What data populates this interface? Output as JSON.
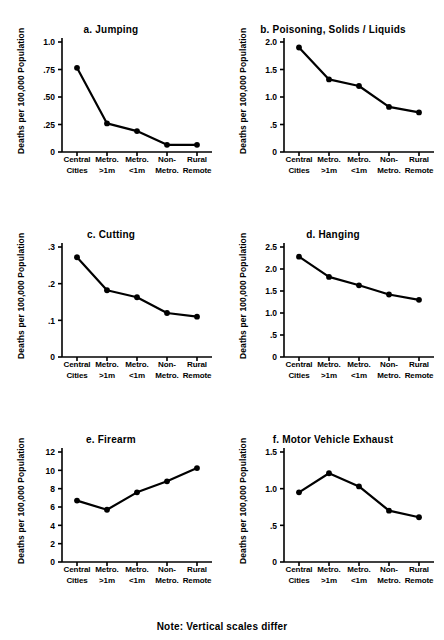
{
  "figure": {
    "footnote": "Note: Vertical scales differ",
    "y_axis_label": "Deaths per 100,000 Population",
    "categories": [
      "Central\nCities",
      "Metro.\n>1m",
      "Metro.\n<1m",
      "Non-\nMetro.",
      "Rural\nRemote"
    ],
    "category_lines": [
      [
        "Central",
        "Cities"
      ],
      [
        "Metro.",
        ">1m"
      ],
      [
        "Metro.",
        "<1m"
      ],
      [
        "Non-",
        "Metro."
      ],
      [
        "Rural",
        "Remote"
      ]
    ],
    "line_color": "#000000",
    "marker_color": "#000000",
    "background": "#ffffff"
  },
  "chart_data": [
    {
      "type": "line",
      "panel": "a",
      "title": "a. Jumping",
      "xlabel": "",
      "ylabel": "Deaths per 100,000 Population",
      "categories": [
        "Central Cities",
        "Metro. >1m",
        "Metro. <1m",
        "Non-Metro.",
        "Rural Remote"
      ],
      "values": [
        0.765,
        0.26,
        0.19,
        0.065,
        0.065
      ],
      "ylim": [
        0,
        1.0
      ],
      "yticks": [
        0,
        0.25,
        0.5,
        0.75,
        1.0
      ],
      "ytick_labels": [
        "0",
        ".25",
        ".50",
        ".75",
        "1.0"
      ],
      "grid": false,
      "legend": "none"
    },
    {
      "type": "line",
      "panel": "b",
      "title": "b. Poisoning, Solids / Liquids",
      "xlabel": "",
      "ylabel": "Deaths per 100,000 Population",
      "categories": [
        "Central Cities",
        "Metro. >1m",
        "Metro. <1m",
        "Non-Metro.",
        "Rural Remote"
      ],
      "values": [
        1.9,
        1.32,
        1.2,
        0.82,
        0.72
      ],
      "ylim": [
        0,
        2.0
      ],
      "yticks": [
        0,
        0.5,
        1.0,
        1.5,
        2.0
      ],
      "ytick_labels": [
        "0",
        ".5",
        "1.0",
        "1.5",
        "2.0"
      ],
      "grid": false,
      "legend": "none"
    },
    {
      "type": "line",
      "panel": "c",
      "title": "c. Cutting",
      "xlabel": "",
      "ylabel": "Deaths per 100,000 Population",
      "categories": [
        "Central Cities",
        "Metro. >1m",
        "Metro. <1m",
        "Non-Metro.",
        "Rural Remote"
      ],
      "values": [
        0.272,
        0.182,
        0.163,
        0.12,
        0.11
      ],
      "ylim": [
        0,
        0.3
      ],
      "yticks": [
        0,
        0.1,
        0.2,
        0.3
      ],
      "ytick_labels": [
        "0",
        ".1",
        ".2",
        ".3"
      ],
      "grid": false,
      "legend": "none"
    },
    {
      "type": "line",
      "panel": "d",
      "title": "d. Hanging",
      "xlabel": "",
      "ylabel": "Deaths per 100,000 Population",
      "categories": [
        "Central Cities",
        "Metro. >1m",
        "Metro. <1m",
        "Non-Metro.",
        "Rural Remote"
      ],
      "values": [
        2.28,
        1.82,
        1.63,
        1.42,
        1.3
      ],
      "ylim": [
        0,
        2.5
      ],
      "yticks": [
        0,
        0.5,
        1.0,
        1.5,
        2.0,
        2.5
      ],
      "ytick_labels": [
        "0",
        ".5",
        "1.0",
        "1.5",
        "2.0",
        "2.5"
      ],
      "grid": false,
      "legend": "none"
    },
    {
      "type": "line",
      "panel": "e",
      "title": "e. Firearm",
      "xlabel": "",
      "ylabel": "Deaths per 100,000 Population",
      "categories": [
        "Central Cities",
        "Metro. >1m",
        "Metro. <1m",
        "Non-Metro.",
        "Rural Remote"
      ],
      "values": [
        6.7,
        5.7,
        7.6,
        8.8,
        10.25
      ],
      "ylim": [
        0,
        12
      ],
      "yticks": [
        0,
        2,
        4,
        6,
        8,
        10,
        12
      ],
      "ytick_labels": [
        "0",
        "2",
        "4",
        "6",
        "8",
        "10",
        "12"
      ],
      "grid": false,
      "legend": "none"
    },
    {
      "type": "line",
      "panel": "f",
      "title": "f. Motor Vehicle Exhaust",
      "xlabel": "",
      "ylabel": "Deaths per 100,000 Population",
      "categories": [
        "Central Cities",
        "Metro. >1m",
        "Metro. <1m",
        "Non-Metro.",
        "Rural Remote"
      ],
      "values": [
        0.95,
        1.21,
        1.03,
        0.7,
        0.61
      ],
      "ylim": [
        0,
        1.5
      ],
      "yticks": [
        0,
        0.5,
        1.0,
        1.5
      ],
      "ytick_labels": [
        "0",
        ".5",
        "1.0",
        "1.5"
      ],
      "grid": false,
      "legend": "none"
    }
  ]
}
